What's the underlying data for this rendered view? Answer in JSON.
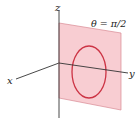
{
  "figure": {
    "axes": {
      "x_label": "x",
      "y_label": "y",
      "z_label": "z"
    },
    "plane_label": "θ = π/2",
    "colors": {
      "plane_fill": "#f8cdd2",
      "plane_edge": "#d98a94",
      "circle": "#cc3344",
      "axis": "#333333"
    }
  }
}
